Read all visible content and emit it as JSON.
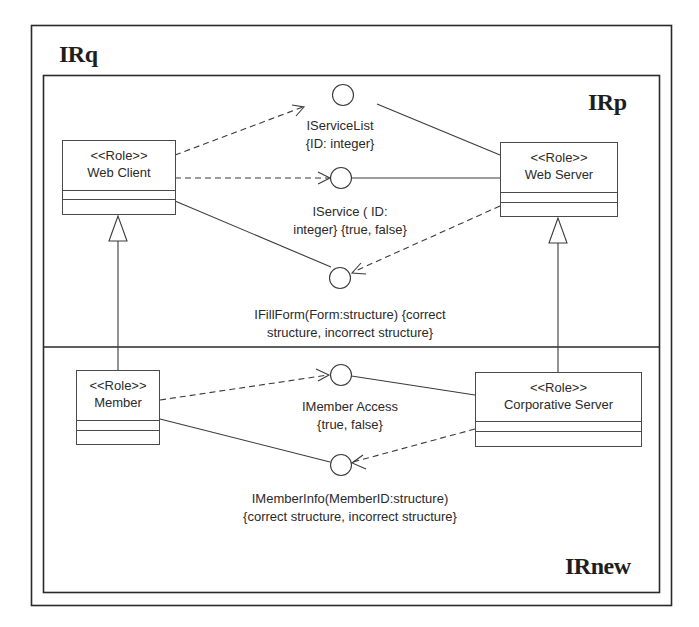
{
  "frames": {
    "outer": {
      "label": "IRq"
    },
    "inner_top": {
      "label": "IRp"
    },
    "inner_bottom": {
      "label": "IRnew"
    }
  },
  "roles": [
    {
      "id": "web-client",
      "stereotype": "<<Role>>",
      "name": "Web Client"
    },
    {
      "id": "web-server",
      "stereotype": "<<Role>>",
      "name": "Web Server"
    },
    {
      "id": "member",
      "stereotype": "<<Role>>",
      "name": "Member"
    },
    {
      "id": "corporative-server",
      "stereotype": "<<Role>>",
      "name": "Corporative Server"
    }
  ],
  "interfaces": [
    {
      "id": "iservicelist",
      "line1": "IServiceList",
      "line2": "{ID: integer}"
    },
    {
      "id": "iservice",
      "line1": "IService ( ID:",
      "line2": "integer} {true, false}"
    },
    {
      "id": "ifillform",
      "line1": "IFillForm(Form:structure) {correct",
      "line2": "structure, incorrect structure}"
    },
    {
      "id": "imemberaccess",
      "line1": "IMember Access",
      "line2": "{true, false}"
    },
    {
      "id": "imemberinfo",
      "line1": "IMemberInfo(MemberID:structure)",
      "line2": "{correct structure, incorrect structure}"
    }
  ],
  "relationships": [
    {
      "type": "dependency",
      "from": "Web Client",
      "to": "IServiceList"
    },
    {
      "type": "association",
      "from": "Web Server",
      "to": "IServiceList"
    },
    {
      "type": "dependency",
      "from": "Web Client",
      "to": "IService"
    },
    {
      "type": "association",
      "from": "Web Server",
      "to": "IService"
    },
    {
      "type": "association",
      "from": "Web Client",
      "to": "IFillForm"
    },
    {
      "type": "dependency",
      "from": "Web Server",
      "to": "IFillForm"
    },
    {
      "type": "dependency",
      "from": "Member",
      "to": "IMember Access"
    },
    {
      "type": "association",
      "from": "Corporative Server",
      "to": "IMember Access"
    },
    {
      "type": "association",
      "from": "Member",
      "to": "IMemberInfo"
    },
    {
      "type": "dependency",
      "from": "Corporative Server",
      "to": "IMemberInfo"
    },
    {
      "type": "generalization",
      "from": "Member",
      "to": "Web Client"
    },
    {
      "type": "generalization",
      "from": "Corporative Server",
      "to": "Web Server"
    }
  ],
  "colors": {
    "line": "#3a3a3a",
    "frame": "#2a2a2a",
    "text": "#2a2a2a",
    "background": "#ffffff"
  }
}
